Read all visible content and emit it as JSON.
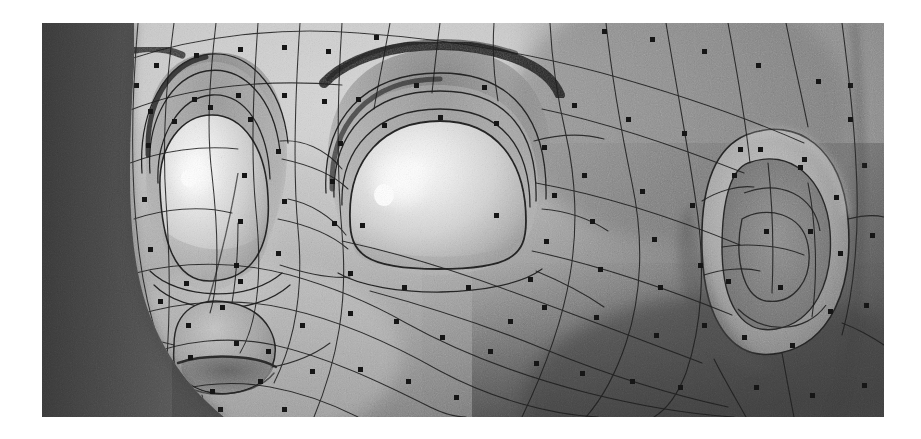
{
  "figure": {
    "view": "three-quarter close-up of upper face: both eyes, brow, nose and left ear",
    "render_style": "grayscale shaded surface with overlaid quadrilateral control mesh and control-point markers",
    "has_text_labels": false,
    "frame": {
      "x": 42,
      "y": 23,
      "width": 842,
      "height": 394,
      "page_background": "#ffffff",
      "border": "none"
    },
    "palette": {
      "page_background": "#ffffff",
      "background_dark": "#4e4e4e",
      "background_darker": "#3f3f3f",
      "skin_light": "#c9c9c9",
      "skin_mid": "#a8a8a8",
      "skin_shadow": "#8a8a8a",
      "skin_deep_shadow": "#6f6f6f",
      "eye_white_bright": "#f2f2f2",
      "eye_highlight": "#ffffff",
      "eye_socket_shadow": "#7a7a7a",
      "brow_dark": "#2e2e2e",
      "mesh_line": "#1c1c1c",
      "control_point": "#141414"
    },
    "grain": {
      "enabled": true,
      "description": "heavy film-grain / dithering noise across the entire render",
      "opacity": 0.34
    }
  },
  "features": [
    {
      "name": "left-eye",
      "label": "Left eye (viewer left)",
      "type": "eyeball",
      "cx": 175,
      "cy": 185,
      "rx": 62,
      "ry": 92,
      "highlight": {
        "cx": 152,
        "cy": 152,
        "r": 13
      },
      "lid_contours": 4
    },
    {
      "name": "right-eye",
      "label": "Right eye (viewer right)",
      "type": "eyeball",
      "cx": 395,
      "cy": 185,
      "rx": 92,
      "ry": 88,
      "highlight": {
        "cx": 355,
        "cy": 160,
        "r": 17
      },
      "lid_contours": 4
    },
    {
      "name": "left-eyebrow",
      "label": "Eyebrow over viewer-left eye",
      "type": "brow-arc",
      "stroke_width": 7
    },
    {
      "name": "right-eyebrow",
      "label": "Eyebrow over viewer-right eye",
      "type": "brow-arc",
      "stroke_width": 10
    },
    {
      "name": "nose",
      "label": "Nose with nostril",
      "type": "nose",
      "cx": 185,
      "cy": 330
    },
    {
      "name": "ear",
      "label": "Ear",
      "type": "ear",
      "cx": 740,
      "cy": 215,
      "rx": 66,
      "ry": 108
    }
  ],
  "mesh": {
    "type": "quadrilateral-control-mesh",
    "line_color": "#1c1c1c",
    "line_width": 1.1,
    "control_points": {
      "marker": "filled-square",
      "color": "#141414",
      "size": 5,
      "count_visible": 118,
      "description": "one dark square marker near the centre of each mesh quad"
    }
  },
  "chart_data": {
    "type": "heatmap",
    "xlabel": "image x (px, frame-relative)",
    "ylabel": "image y (px, frame-relative)",
    "regions": [
      {
        "name": "background-left",
        "x": [
          0,
          60
        ],
        "y": [
          0,
          394
        ],
        "luminance": 68
      },
      {
        "name": "background-right",
        "x": [
          800,
          842
        ],
        "y": [
          0,
          394
        ],
        "luminance": 72
      },
      {
        "name": "forehead",
        "x": [
          90,
          560
        ],
        "y": [
          0,
          95
        ],
        "luminance": 168
      },
      {
        "name": "left-eye-white",
        "x": [
          115,
          235
        ],
        "y": [
          95,
          275
        ],
        "luminance": 232
      },
      {
        "name": "right-eye-white",
        "x": [
          305,
          487
        ],
        "y": [
          100,
          272
        ],
        "luminance": 238
      },
      {
        "name": "eye-highlight",
        "x": [
          340,
          372
        ],
        "y": [
          145,
          178
        ],
        "luminance": 255
      },
      {
        "name": "eye-socket",
        "x": [
          290,
          500
        ],
        "y": [
          60,
          120
        ],
        "luminance": 120
      },
      {
        "name": "eyebrow",
        "x": [
          300,
          520
        ],
        "y": [
          30,
          70
        ],
        "luminance": 46
      },
      {
        "name": "cheek-mid",
        "x": [
          240,
          520
        ],
        "y": [
          280,
          394
        ],
        "luminance": 176
      },
      {
        "name": "cheek-shadow",
        "x": [
          520,
          720
        ],
        "y": [
          230,
          394
        ],
        "luminance": 118
      },
      {
        "name": "nose",
        "x": [
          130,
          250
        ],
        "y": [
          280,
          380
        ],
        "luminance": 158
      },
      {
        "name": "nostril",
        "x": [
          150,
          225
        ],
        "y": [
          330,
          368
        ],
        "luminance": 92
      },
      {
        "name": "ear-outer",
        "x": [
          676,
          812
        ],
        "y": [
          105,
          330
        ],
        "luminance": 150
      },
      {
        "name": "ear-inner",
        "x": [
          700,
          780
        ],
        "y": [
          150,
          300
        ],
        "luminance": 112
      },
      {
        "name": "jaw-dark",
        "x": [
          560,
          842
        ],
        "y": [
          300,
          394
        ],
        "luminance": 88
      }
    ],
    "colormap": "grayscale",
    "vmin": 0,
    "vmax": 255,
    "grid": false,
    "legend": "none"
  }
}
